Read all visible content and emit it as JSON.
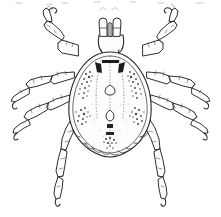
{
  "figure": {
    "view": "dorsal",
    "style": "black-and-white line engraving",
    "background_color": "#ffffff",
    "ink_color": "#2b2b2b",
    "width_px": 221,
    "height_px": 217,
    "caption": ""
  },
  "anatomy": {
    "capitulum": {
      "label": "capitulum",
      "parts": [
        {
          "name": "palp-left",
          "label": "left palp"
        },
        {
          "name": "hypostome",
          "label": "hypostome"
        },
        {
          "name": "palp-right",
          "label": "right palp"
        },
        {
          "name": "basis-capituli",
          "label": "basis capituli"
        }
      ]
    },
    "idiosoma": {
      "label": "idiosoma",
      "shape": "pear-shaped",
      "features": [
        {
          "name": "scutum",
          "label": "scutum"
        },
        {
          "name": "cervical-grooves",
          "label": "cervical grooves"
        },
        {
          "name": "anterior-dark-dashes",
          "label": "anterior dark dashes",
          "count": 2
        },
        {
          "name": "midline-ornaments",
          "label": "median ornamentation",
          "count": 4
        },
        {
          "name": "lateral-stipple-patches",
          "label": "lateral stippled patches",
          "count": 4
        },
        {
          "name": "festoons",
          "label": "posterior festoons",
          "count": 11
        }
      ]
    },
    "legs": {
      "label": "legs",
      "count": 8,
      "segments_per_leg": [
        "coxa",
        "trochanter",
        "femur",
        "tibia",
        "tarsus",
        "claw"
      ],
      "items": [
        {
          "name": "leg-front-left",
          "label": "front left leg",
          "side": "left",
          "pair": 1
        },
        {
          "name": "leg-front-right",
          "label": "front right leg",
          "side": "right",
          "pair": 1
        },
        {
          "name": "leg-second-left",
          "label": "second left leg",
          "side": "left",
          "pair": 2
        },
        {
          "name": "leg-second-right",
          "label": "second right leg",
          "side": "right",
          "pair": 2
        },
        {
          "name": "leg-third-left",
          "label": "third left leg",
          "side": "left",
          "pair": 3
        },
        {
          "name": "leg-third-right",
          "label": "third right leg",
          "side": "right",
          "pair": 3
        },
        {
          "name": "leg-hind-left",
          "label": "hind left leg",
          "side": "left",
          "pair": 4
        },
        {
          "name": "leg-hind-right",
          "label": "hind right leg",
          "side": "right",
          "pair": 4
        }
      ]
    }
  },
  "artifacts": {
    "label": "scan artifacts along top edge",
    "count": 3
  }
}
